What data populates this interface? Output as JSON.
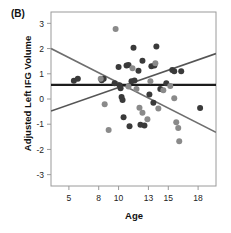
{
  "figure": {
    "panel_label": "(B)",
    "background_color": "#ffffff"
  },
  "chart_data": {
    "type": "scatter",
    "title": "",
    "panel": "(B)",
    "xlabel": "Age",
    "ylabel": "Adjusted Left IFG Volume",
    "xlim": [
      3.2,
      19.8
    ],
    "ylim": [
      -3.45,
      3.45
    ],
    "xticks": [
      5,
      8,
      10,
      13,
      15,
      18
    ],
    "xtick_labels": [
      "5",
      "8",
      "10",
      "13",
      "15",
      "18"
    ],
    "yticks": [
      3,
      2,
      1,
      0,
      -1,
      -2,
      -3
    ],
    "ytick_labels": [
      "3",
      "2",
      "1",
      "0",
      "-1",
      "-2",
      "-3"
    ],
    "grid": false,
    "legend": false,
    "legend_position": "none",
    "series": [
      {
        "name": "dark-group",
        "color": "#3a3a3a",
        "marker": "circle",
        "points": [
          [
            5.5,
            0.72
          ],
          [
            5.9,
            0.8
          ],
          [
            8.3,
            0.74
          ],
          [
            8.5,
            0.8
          ],
          [
            9.6,
            0.62
          ],
          [
            10.0,
            1.27
          ],
          [
            10.1,
            0.55
          ],
          [
            10.2,
            0.43
          ],
          [
            10.3,
            0.08
          ],
          [
            10.4,
            -0.04
          ],
          [
            10.5,
            -0.72
          ],
          [
            10.8,
            1.33
          ],
          [
            11.0,
            1.35
          ],
          [
            11.1,
            -1.08
          ],
          [
            11.3,
            0.7
          ],
          [
            11.5,
            2.03
          ],
          [
            11.6,
            0.73
          ],
          [
            12.0,
            1.12
          ],
          [
            12.2,
            -1.02
          ],
          [
            12.4,
            1.52
          ],
          [
            12.6,
            -1.05
          ],
          [
            13.1,
            0.18
          ],
          [
            13.3,
            1.3
          ],
          [
            13.5,
            -0.15
          ],
          [
            13.6,
            1.33
          ],
          [
            13.8,
            2.08
          ],
          [
            14.2,
            0.4
          ],
          [
            14.8,
            0.62
          ],
          [
            15.4,
            1.15
          ],
          [
            15.6,
            1.1
          ],
          [
            16.3,
            1.1
          ],
          [
            18.2,
            -0.36
          ]
        ]
      },
      {
        "name": "light-group",
        "color": "#8a8a8a",
        "marker": "circle",
        "points": [
          [
            8.2,
            0.8
          ],
          [
            8.6,
            -0.21
          ],
          [
            9.0,
            -1.23
          ],
          [
            9.7,
            2.78
          ],
          [
            11.0,
            0.5
          ],
          [
            11.4,
            1.22
          ],
          [
            11.8,
            0.4
          ],
          [
            12.1,
            -0.35
          ],
          [
            12.4,
            -0.55
          ],
          [
            12.9,
            -0.8
          ],
          [
            13.2,
            0.7
          ],
          [
            13.7,
            1.42
          ],
          [
            14.0,
            -0.38
          ],
          [
            14.5,
            0.35
          ],
          [
            15.2,
            0.52
          ],
          [
            15.6,
            0.03
          ],
          [
            15.8,
            -0.92
          ],
          [
            16.0,
            -1.15
          ],
          [
            16.1,
            -1.68
          ]
        ]
      }
    ],
    "lines": [
      {
        "name": "negative-slope-regression",
        "color": "#6e6e6e",
        "width": 1.6,
        "x0": 3.2,
        "y0": 2.0,
        "x1": 19.8,
        "y1": -1.32
      },
      {
        "name": "positive-slope-regression",
        "color": "#555555",
        "width": 1.6,
        "x0": 3.2,
        "y0": -0.48,
        "x1": 19.8,
        "y1": 1.8
      },
      {
        "name": "horizontal-reference",
        "color": "#1c1c1c",
        "width": 2.2,
        "x0": 3.2,
        "y0": 0.56,
        "x1": 19.8,
        "y1": 0.56
      }
    ],
    "frame_color": "#9a9a9a",
    "point_radius": 3.0
  }
}
